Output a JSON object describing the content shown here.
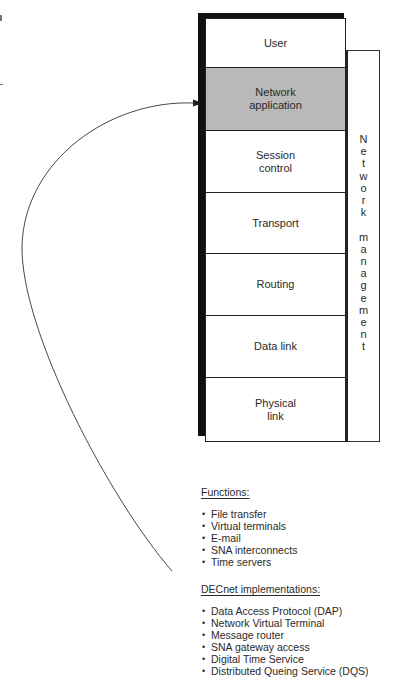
{
  "diagram": {
    "stack_layers": [
      {
        "label": "User",
        "highlighted": false
      },
      {
        "label": "Network\napplication",
        "highlighted": true
      },
      {
        "label": "Session\ncontrol",
        "highlighted": false
      },
      {
        "label": "Transport",
        "highlighted": false
      },
      {
        "label": "Routing",
        "highlighted": false
      },
      {
        "label": "Data link",
        "highlighted": false
      },
      {
        "label": "Physical\nlink",
        "highlighted": false
      }
    ],
    "side_column": {
      "label": "Network management",
      "letters": [
        "N",
        "e",
        "t",
        "w",
        "o",
        "r",
        "k",
        "",
        "m",
        "a",
        "n",
        "a",
        "g",
        "e",
        "m",
        "e",
        "n",
        "t"
      ]
    },
    "arrow": {
      "from": "functions-list",
      "to": "Network application"
    },
    "colors": {
      "highlight_fill": "#b9b9b9",
      "shadow": "#111111",
      "line": "#222222"
    }
  },
  "functions": {
    "title": "Functions:",
    "items": [
      "File transfer",
      "Virtual terminals",
      "E-mail",
      "SNA interconnects",
      "Time servers"
    ]
  },
  "implementations": {
    "title": "DECnet implementations:",
    "items": [
      "Data Access Protocol (DAP)",
      "Network Virtual Terminal",
      "Message router",
      "SNA gateway access",
      "Digital Time Service",
      "Distributed Queing Service (DQS)"
    ]
  }
}
